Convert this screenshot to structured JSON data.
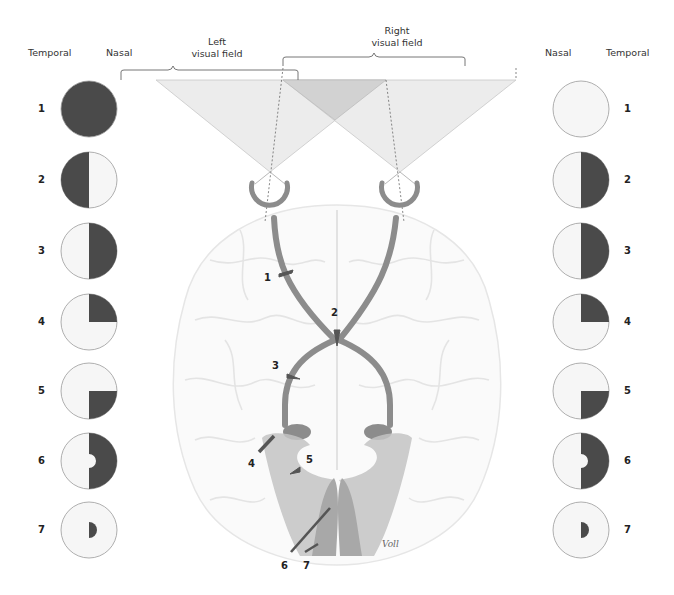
{
  "headers": {
    "left_temporal": "Temporal",
    "left_nasal": "Nasal",
    "right_nasal": "Nasal",
    "right_temporal": "Temporal",
    "left_field_line1": "Left",
    "left_field_line2": "visual field",
    "right_field_line1": "Right",
    "right_field_line2": "visual field"
  },
  "colors": {
    "defect": "#4a4a4a",
    "intact": "#f6f6f6",
    "outline": "#9a9a9a",
    "pathway": "#8c8c8c",
    "radiation": "#c4c4c4",
    "field_light": "#ececec",
    "field_overlap": "#d2d2d2"
  },
  "left_eye_fields": [
    {
      "label": "1",
      "defect": "complete"
    },
    {
      "label": "2",
      "defect": "temporal-half"
    },
    {
      "label": "3",
      "defect": "nasal-half"
    },
    {
      "label": "4",
      "defect": "nasal-upper-quadrant"
    },
    {
      "label": "5",
      "defect": "nasal-lower-quadrant"
    },
    {
      "label": "6",
      "defect": "nasal-half-macular-sparing"
    },
    {
      "label": "7",
      "defect": "nasal-central-small"
    }
  ],
  "right_eye_fields": [
    {
      "label": "1",
      "defect": "none"
    },
    {
      "label": "2",
      "defect": "temporal-half"
    },
    {
      "label": "3",
      "defect": "temporal-half"
    },
    {
      "label": "4",
      "defect": "temporal-upper-quadrant"
    },
    {
      "label": "5",
      "defect": "temporal-lower-quadrant"
    },
    {
      "label": "6",
      "defect": "temporal-half-macular-sparing"
    },
    {
      "label": "7",
      "defect": "temporal-central-small"
    }
  ],
  "lesion_labels": [
    "1",
    "2",
    "3",
    "4",
    "5",
    "6",
    "7"
  ],
  "signature": "Voll"
}
